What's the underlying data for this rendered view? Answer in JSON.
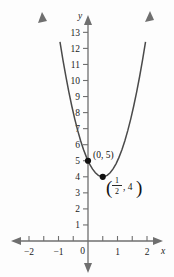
{
  "chart_data": {
    "type": "line",
    "title": "",
    "subtitle": "",
    "xlabel": "x",
    "ylabel": "y",
    "grid": false,
    "legend": "none",
    "xlim": [
      -2.35,
      2.35
    ],
    "ylim": [
      -0.9,
      13.9
    ],
    "x_ticks": [
      -2,
      -1.5,
      -1,
      -0.5,
      0,
      0.5,
      1,
      1.5,
      2
    ],
    "x_tick_labels": [
      "-2",
      "",
      "-1",
      "",
      "0",
      "",
      "1",
      "",
      "2"
    ],
    "y_ticks": [
      1,
      2,
      3,
      4,
      5,
      6,
      7,
      8,
      9,
      10,
      11,
      12,
      13
    ],
    "y_tick_labels": [
      "1",
      "2",
      "3",
      "4",
      "5",
      "6",
      "7",
      "8",
      "9",
      "10",
      "11",
      "12",
      "13"
    ],
    "equation": "y = 4(x - 1/2)^2 + 4",
    "vertex": [
      0.5,
      4
    ],
    "y_intercept": [
      0,
      5
    ],
    "series": [
      {
        "name": "parabola",
        "color": "#4a4a4a",
        "x": [
          -0.95,
          -0.85,
          -0.75,
          -0.65,
          -0.55,
          -0.45,
          -0.35,
          -0.25,
          -0.15,
          -0.05,
          0.05,
          0.15,
          0.25,
          0.35,
          0.45,
          0.5,
          0.55,
          0.65,
          0.75,
          0.85,
          0.95,
          1.05,
          1.15,
          1.25,
          1.35,
          1.45,
          1.55,
          1.65,
          1.75,
          1.85,
          1.95
        ],
        "y": [
          12.41,
          11.29,
          10.25,
          9.29,
          8.41,
          7.61,
          6.89,
          6.25,
          5.69,
          5.21,
          4.81,
          4.49,
          4.25,
          4.09,
          4.01,
          4.0,
          4.01,
          4.09,
          4.25,
          4.49,
          4.81,
          5.21,
          5.69,
          6.25,
          6.89,
          7.61,
          8.41,
          9.29,
          10.25,
          11.29,
          12.41
        ]
      }
    ],
    "annotations": [
      {
        "name": "y-intercept-label",
        "text": "(0, 5)",
        "x": 0,
        "y": 5
      },
      {
        "name": "vertex-label",
        "text_open_paren": "(",
        "numerator": "1",
        "denominator": "2",
        "text_rest": ", 4",
        "text_close_paren": ")",
        "x": 0.5,
        "y": 4
      }
    ],
    "points": [
      {
        "name": "y-intercept-point",
        "x": 0,
        "y": 5
      },
      {
        "name": "vertex-point",
        "x": 0.5,
        "y": 4
      }
    ]
  },
  "axes": {
    "x_axis_label": "x",
    "y_axis_label": "y",
    "origin_label": "0"
  }
}
